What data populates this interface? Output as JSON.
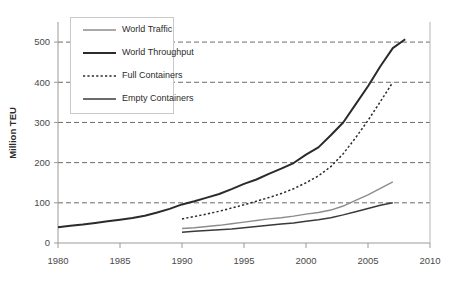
{
  "chart_data": {
    "type": "line",
    "title": "",
    "subtitle": "",
    "xlabel": "",
    "ylabel": "Million TEU",
    "xlim": [
      1980,
      2010
    ],
    "ylim": [
      0,
      550
    ],
    "x_ticks": [
      1980,
      1985,
      1990,
      1995,
      2000,
      2005,
      2010
    ],
    "y_ticks": [
      0,
      100,
      200,
      300,
      400,
      500
    ],
    "grid": "horizontal-dashed",
    "legend_position": "top-left-inside",
    "series": [
      {
        "name": "World Traffic",
        "color": "#8c8c8c",
        "style": "solid",
        "width": 1.4,
        "x": [
          1990,
          1991,
          1992,
          1993,
          1994,
          1995,
          1996,
          1997,
          1998,
          1999,
          2000,
          2001,
          2002,
          2003,
          2004,
          2005,
          2006,
          2007
        ],
        "values": [
          36,
          38,
          41,
          44,
          48,
          52,
          56,
          60,
          63,
          67,
          72,
          76,
          82,
          92,
          106,
          120,
          136,
          152
        ]
      },
      {
        "name": "World Throughput",
        "color": "#2b2b2b",
        "style": "solid",
        "width": 2.0,
        "x": [
          1980,
          1981,
          1982,
          1983,
          1984,
          1985,
          1986,
          1987,
          1988,
          1989,
          1990,
          1991,
          1992,
          1993,
          1994,
          1995,
          1996,
          1997,
          1998,
          1999,
          2000,
          2001,
          2002,
          2003,
          2004,
          2005,
          2006,
          2007,
          2008
        ],
        "values": [
          39,
          43,
          46,
          50,
          54,
          58,
          62,
          68,
          76,
          85,
          96,
          104,
          113,
          122,
          134,
          147,
          158,
          172,
          185,
          199,
          220,
          238,
          268,
          300,
          345,
          390,
          440,
          485,
          507
        ]
      },
      {
        "name": "Full Containers",
        "color": "#2b2b2b",
        "style": "dotted",
        "width": 1.5,
        "x": [
          1990,
          1991,
          1992,
          1993,
          1994,
          1995,
          1996,
          1997,
          1998,
          1999,
          2000,
          2001,
          2002,
          2003,
          2004,
          2005,
          2006,
          2007
        ],
        "values": [
          60,
          66,
          72,
          79,
          87,
          95,
          104,
          113,
          123,
          135,
          150,
          167,
          190,
          222,
          262,
          305,
          352,
          400
        ]
      },
      {
        "name": "Empty Containers",
        "color": "#3a3a3a",
        "style": "solid",
        "width": 1.5,
        "x": [
          1990,
          1991,
          1992,
          1993,
          1994,
          1995,
          1996,
          1997,
          1998,
          1999,
          2000,
          2001,
          2002,
          2003,
          2004,
          2005,
          2006,
          2007
        ],
        "values": [
          27,
          29,
          31,
          33,
          35,
          38,
          41,
          44,
          47,
          50,
          54,
          58,
          63,
          70,
          78,
          86,
          94,
          100
        ]
      }
    ]
  },
  "axis": {
    "y_title": "Million TEU",
    "y_tick_labels": [
      "0",
      "100",
      "200",
      "300",
      "400",
      "500"
    ],
    "x_tick_labels": [
      "1980",
      "1985",
      "1990",
      "1995",
      "2000",
      "2005",
      "2010"
    ]
  },
  "legend": {
    "entries": [
      {
        "label": "World Traffic",
        "key": "world-traffic"
      },
      {
        "label": "World Throughput",
        "key": "world-throughput"
      },
      {
        "label": "Full Containers",
        "key": "full-containers"
      },
      {
        "label": "Empty Containers",
        "key": "empty-containers"
      }
    ]
  },
  "colors": {
    "world_traffic": "#8c8c8c",
    "world_throughput": "#2b2b2b",
    "full_containers": "#2b2b2b",
    "empty_containers": "#3a3a3a",
    "gridline": "#5a5a5a",
    "axis": "#9a9a9a",
    "background": "#ffffff"
  }
}
